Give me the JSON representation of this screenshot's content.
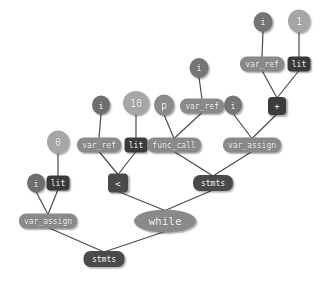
{
  "diagram": {
    "kind": "ast-tree",
    "background": "#ffffff",
    "edge_color": "#4a4a4a",
    "palette": {
      "light": "#a8a8a8",
      "medium": "#8a8a8a",
      "dark_medium": "#6e6e6e",
      "dark": "#4a4a4a",
      "very_dark": "#3c3c3c"
    },
    "nodes": [
      {
        "id": "n_i_top",
        "label": "i",
        "shape": "ellipse",
        "fill": "#757575",
        "x": 263,
        "y": 22,
        "w": 19,
        "h": 20,
        "fs": 9
      },
      {
        "id": "n_1_top",
        "label": "1",
        "shape": "ellipse",
        "fill": "#a6a6a6",
        "x": 299,
        "y": 21,
        "w": 22,
        "h": 23,
        "fs": 10
      },
      {
        "id": "n_varref_tr",
        "label": "var_ref",
        "shape": "rrect",
        "fill": "#8a8a8a",
        "x": 262,
        "y": 64,
        "w": 44,
        "h": 15,
        "fs": 8
      },
      {
        "id": "n_lit_tr",
        "label": "lit",
        "shape": "srect",
        "fill": "#3a3a3a",
        "x": 299,
        "y": 64,
        "w": 23,
        "h": 15,
        "fs": 8
      },
      {
        "id": "n_i_mid",
        "label": "i",
        "shape": "ellipse",
        "fill": "#757575",
        "x": 199,
        "y": 68,
        "w": 19,
        "h": 20,
        "fs": 9
      },
      {
        "id": "n_i_left",
        "label": "i",
        "shape": "ellipse",
        "fill": "#6e6e6e",
        "x": 101,
        "y": 105,
        "w": 18,
        "h": 19,
        "fs": 9
      },
      {
        "id": "n_10",
        "label": "10",
        "shape": "ellipse",
        "fill": "#a6a6a6",
        "x": 136,
        "y": 103,
        "w": 26,
        "h": 24,
        "fs": 10
      },
      {
        "id": "n_p",
        "label": "p",
        "shape": "ellipse",
        "fill": "#8a8a8a",
        "x": 164,
        "y": 105,
        "w": 20,
        "h": 21,
        "fs": 10
      },
      {
        "id": "n_varref_mid",
        "label": "var_ref",
        "shape": "rrect",
        "fill": "#8a8a8a",
        "x": 202,
        "y": 106,
        "w": 44,
        "h": 15,
        "fs": 8
      },
      {
        "id": "n_i_right",
        "label": "i",
        "shape": "ellipse",
        "fill": "#757575",
        "x": 233,
        "y": 105,
        "w": 18,
        "h": 19,
        "fs": 9
      },
      {
        "id": "n_plus",
        "label": "+",
        "shape": "srect",
        "fill": "#3c3c3c",
        "x": 277,
        "y": 106,
        "w": 18,
        "h": 18,
        "fs": 9
      },
      {
        "id": "n_0",
        "label": "0",
        "shape": "ellipse",
        "fill": "#a6a6a6",
        "x": 58,
        "y": 142,
        "w": 22,
        "h": 23,
        "fs": 10
      },
      {
        "id": "n_varref_l",
        "label": "var_ref",
        "shape": "rrect",
        "fill": "#8a8a8a",
        "x": 99,
        "y": 145,
        "w": 44,
        "h": 15,
        "fs": 8
      },
      {
        "id": "n_lit_mid",
        "label": "lit",
        "shape": "srect",
        "fill": "#3a3a3a",
        "x": 136,
        "y": 145,
        "w": 23,
        "h": 15,
        "fs": 8
      },
      {
        "id": "n_funccall",
        "label": "func_call",
        "shape": "rrect",
        "fill": "#8a8a8a",
        "x": 174,
        "y": 145,
        "w": 54,
        "h": 15,
        "fs": 8
      },
      {
        "id": "n_varassign_r",
        "label": "var_assign",
        "shape": "rrect",
        "fill": "#8a8a8a",
        "x": 252,
        "y": 145,
        "w": 58,
        "h": 15,
        "fs": 8
      },
      {
        "id": "n_i_bl",
        "label": "i",
        "shape": "ellipse",
        "fill": "#6e6e6e",
        "x": 36,
        "y": 183,
        "w": 18,
        "h": 19,
        "fs": 9
      },
      {
        "id": "n_lit_bl",
        "label": "lit",
        "shape": "srect",
        "fill": "#3a3a3a",
        "x": 58,
        "y": 183,
        "w": 23,
        "h": 15,
        "fs": 8
      },
      {
        "id": "n_lt",
        "label": "<",
        "shape": "srect",
        "fill": "#4a4a4a",
        "x": 118,
        "y": 183,
        "w": 20,
        "h": 19,
        "fs": 9
      },
      {
        "id": "n_stmts_mid",
        "label": "stmts",
        "shape": "rrect",
        "fill": "#4a4a4a",
        "x": 213,
        "y": 183,
        "w": 40,
        "h": 16,
        "fs": 8
      },
      {
        "id": "n_varassign_l",
        "label": "var_assign",
        "shape": "rrect",
        "fill": "#8a8a8a",
        "x": 48,
        "y": 221,
        "w": 58,
        "h": 15,
        "fs": 8
      },
      {
        "id": "n_while",
        "label": "while",
        "shape": "ellipse",
        "fill": "#8a8a8a",
        "x": 165,
        "y": 221,
        "w": 62,
        "h": 23,
        "fs": 11
      },
      {
        "id": "n_stmts_bot",
        "label": "stmts",
        "shape": "rrect",
        "fill": "#4a4a4a",
        "x": 104,
        "y": 259,
        "w": 41,
        "h": 16,
        "fs": 8
      }
    ],
    "edges": [
      {
        "from": "n_i_top",
        "to": "n_varref_tr"
      },
      {
        "from": "n_1_top",
        "to": "n_lit_tr"
      },
      {
        "from": "n_varref_tr",
        "to": "n_plus"
      },
      {
        "from": "n_lit_tr",
        "to": "n_plus"
      },
      {
        "from": "n_i_mid",
        "to": "n_varref_mid"
      },
      {
        "from": "n_i_left",
        "to": "n_varref_l"
      },
      {
        "from": "n_10",
        "to": "n_lit_mid"
      },
      {
        "from": "n_p",
        "to": "n_funccall"
      },
      {
        "from": "n_varref_mid",
        "to": "n_funccall"
      },
      {
        "from": "n_i_right",
        "to": "n_varassign_r"
      },
      {
        "from": "n_plus",
        "to": "n_varassign_r"
      },
      {
        "from": "n_0",
        "to": "n_lit_bl"
      },
      {
        "from": "n_varref_l",
        "to": "n_lt"
      },
      {
        "from": "n_lit_mid",
        "to": "n_lt"
      },
      {
        "from": "n_funccall",
        "to": "n_stmts_mid"
      },
      {
        "from": "n_varassign_r",
        "to": "n_stmts_mid"
      },
      {
        "from": "n_i_bl",
        "to": "n_varassign_l"
      },
      {
        "from": "n_lit_bl",
        "to": "n_varassign_l"
      },
      {
        "from": "n_lt",
        "to": "n_while"
      },
      {
        "from": "n_stmts_mid",
        "to": "n_while"
      },
      {
        "from": "n_varassign_l",
        "to": "n_stmts_bot"
      },
      {
        "from": "n_while",
        "to": "n_stmts_bot"
      }
    ]
  }
}
